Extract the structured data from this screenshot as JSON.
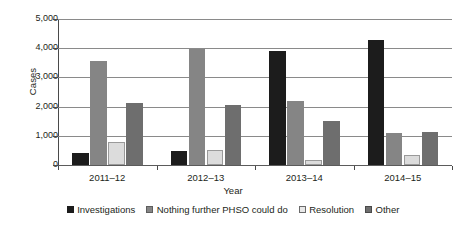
{
  "chart_data": {
    "type": "bar",
    "title": "",
    "xlabel": "Year",
    "ylabel": "Cases",
    "categories": [
      "2011–12",
      "2012–13",
      "2013–14",
      "2014–15"
    ],
    "ylim": [
      0,
      5000
    ],
    "ytick_labels": [
      "5,000",
      "4,000",
      "3,000",
      "2,000",
      "1,000",
      "0"
    ],
    "ytick_values": [
      5000,
      4000,
      3000,
      2000,
      1000,
      0
    ],
    "grid": true,
    "legend_position": "bottom",
    "series": [
      {
        "name": "Investigations",
        "color": "#1c1c1c",
        "values": [
          400,
          470,
          3900,
          4270
        ]
      },
      {
        "name": "Nothing further PHSO could do",
        "color": "#858585",
        "values": [
          3550,
          3980,
          2180,
          1080
        ]
      },
      {
        "name": "Resolution",
        "color": "#dcdcdc",
        "values": [
          780,
          520,
          180,
          350
        ]
      },
      {
        "name": "Other",
        "color": "#6e6e6e",
        "values": [
          2120,
          2060,
          1520,
          1130
        ]
      }
    ]
  }
}
